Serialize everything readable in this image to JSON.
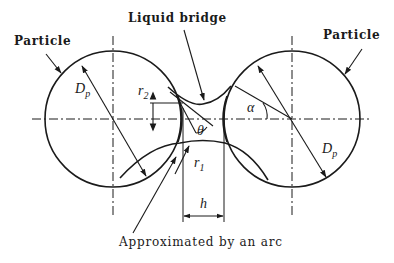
{
  "diagram": {
    "labels": {
      "liquid_bridge": "Liquid bridge",
      "particle_left": "Particle",
      "particle_right": "Particle",
      "approximation": "Approximated by an arc"
    },
    "symbols": {
      "dp_left": {
        "main": "D",
        "sub": "p"
      },
      "dp_right": {
        "main": "D",
        "sub": "p"
      },
      "r2": {
        "main": "r",
        "sub": "2"
      },
      "r1": {
        "main": "r",
        "sub": "1"
      },
      "theta": "θ",
      "alpha": "α",
      "h": "h"
    },
    "geometry": {
      "left_particle_center": [
        113,
        119
      ],
      "right_particle_center": [
        292,
        119
      ],
      "particle_radius": 68,
      "gap_lines_x": [
        183,
        224
      ]
    },
    "colors": {
      "stroke": "#1a1a1a",
      "background": "#ffffff"
    }
  }
}
